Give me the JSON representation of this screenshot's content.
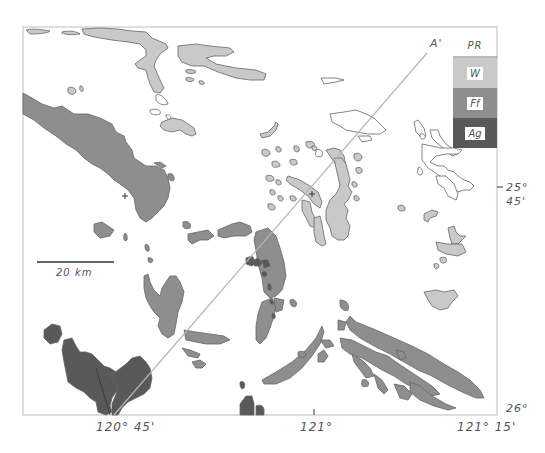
{
  "map": {
    "frame": {
      "left": 23,
      "top": 27,
      "right": 497,
      "bottom": 415,
      "stroke": "#c8c8c8"
    },
    "colors": {
      "W": "#c9c9c9",
      "Ff": "#8e8e8e",
      "Ag": "#595959",
      "PR": "#ffffff",
      "outline": "#555555",
      "section_line": "#b5b5b5"
    },
    "section_line": {
      "start_label": "A",
      "end_label": "A'"
    },
    "scale_bar": {
      "label": "20 km"
    },
    "legend": [
      {
        "code": "PR",
        "name": "PR"
      },
      {
        "code": "W",
        "name": "W"
      },
      {
        "code": "Ff",
        "name": "Ff"
      },
      {
        "code": "Ag",
        "name": "Ag"
      }
    ],
    "x_ticks": [
      "120° 45'",
      "121°",
      "121° 15'"
    ],
    "y_ticks": [
      {
        "deg": "25°",
        "min": "45'"
      },
      {
        "deg": "26°"
      }
    ]
  }
}
